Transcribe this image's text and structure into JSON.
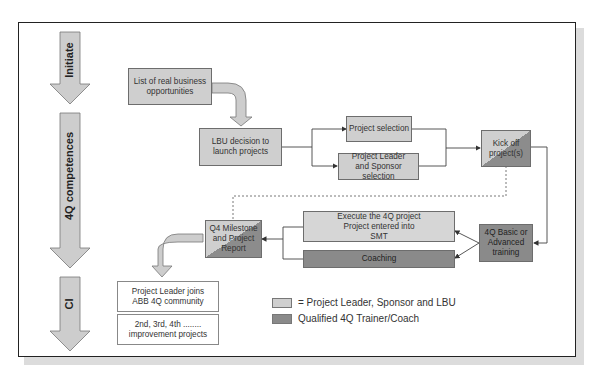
{
  "phases": [
    {
      "label": "Initiate"
    },
    {
      "label": "4Q competences"
    },
    {
      "label": "CI"
    }
  ],
  "boxes": {
    "opportunities": "List of real business opportunities",
    "lbu_decision": "LBU decision to launch projects",
    "project_selection": "Project selection",
    "leader_sponsor_selection": "Project Leader and Sponsor selection",
    "kick_off": "Kick off project(s)",
    "training": "4Q Basic or Advanced training",
    "execute": "Execute the 4Q project Project entered into SMT",
    "coaching": "Coaching",
    "milestone": "Q4 Milestone and Project Report",
    "community": "Project Leader joins ABB 4Q community",
    "improvement_ordinals": "2nd, 3rd, 4th ........",
    "improvement_text": "improvement projects"
  },
  "legend": [
    {
      "label": "= Project Leader, Sponsor and LBU",
      "color": "#cfcfcf"
    },
    {
      "label": "Qualified 4Q Trainer/Coach",
      "color": "#8a8a8a"
    }
  ],
  "colors": {
    "light_fill": "#cfcfcf",
    "dark_fill": "#8a8a8a",
    "arrow_fill": "#cdcdcd",
    "frame": "#222222"
  }
}
